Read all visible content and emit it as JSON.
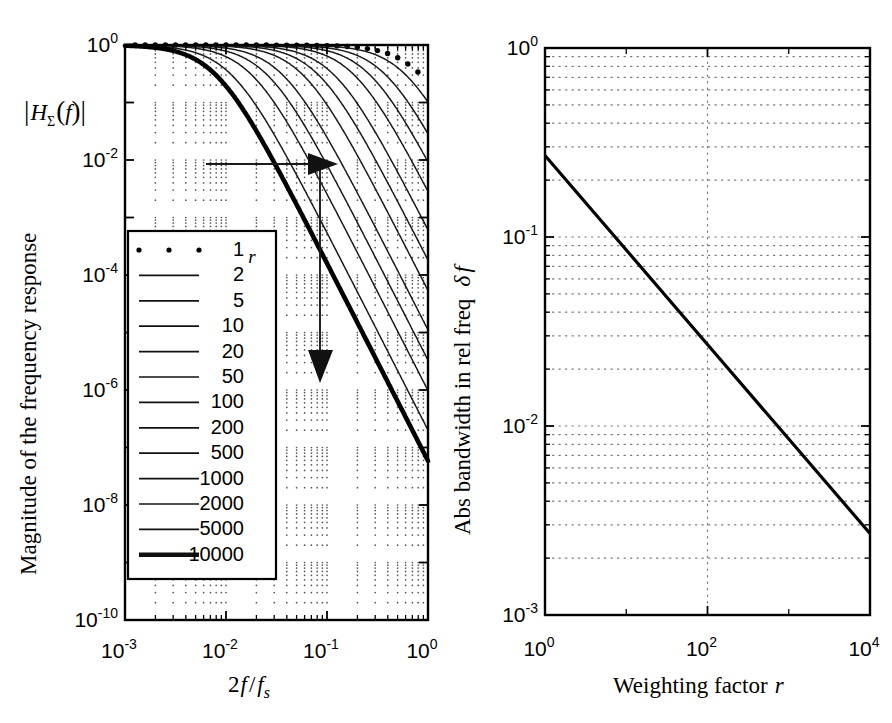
{
  "figure": {
    "title": "",
    "background": "#ffffff",
    "ink_color": "#000000"
  },
  "chart_data": [
    {
      "id": "left-panel",
      "type": "line",
      "title": "",
      "xlabel": "2f/f_s",
      "ylabel": "Magnitude of the frequency response",
      "ylabel_symbol": "|H_Σ(f)|",
      "xscale": "log",
      "yscale": "log",
      "xlim": [
        0.001,
        1.0
      ],
      "ylim": [
        1e-10,
        1.0
      ],
      "xticks": [
        0.001,
        0.01,
        0.1,
        1
      ],
      "xticklabels": [
        "10⁻³",
        "10⁻²",
        "10⁻¹",
        "10⁰"
      ],
      "yticks": [
        1,
        0.01,
        0.0001,
        1e-06,
        1e-08,
        1e-10
      ],
      "yticklabels": [
        "10⁰",
        "10⁻²",
        "10⁻⁴",
        "10⁻⁶",
        "10⁻⁸",
        "10⁻¹⁰"
      ],
      "grid": "dotted-minor",
      "legend_position": "lower-left",
      "legend_title": "r",
      "series": [
        {
          "name": "1",
          "r": 1,
          "style": "dotted-markers",
          "width": 1.5,
          "corner_f": 0.85
        },
        {
          "name": "2",
          "r": 2,
          "style": "solid",
          "width": 1.5,
          "corner_f": 0.6
        },
        {
          "name": "5",
          "r": 5,
          "style": "solid",
          "width": 1.5,
          "corner_f": 0.38
        },
        {
          "name": "10",
          "r": 10,
          "style": "solid",
          "width": 1.5,
          "corner_f": 0.265
        },
        {
          "name": "20",
          "r": 20,
          "style": "solid",
          "width": 1.5,
          "corner_f": 0.185
        },
        {
          "name": "50",
          "r": 50,
          "style": "solid",
          "width": 1.5,
          "corner_f": 0.117
        },
        {
          "name": "100",
          "r": 100,
          "style": "solid",
          "width": 1.5,
          "corner_f": 0.082
        },
        {
          "name": "200",
          "r": 200,
          "style": "solid",
          "width": 1.5,
          "corner_f": 0.0575
        },
        {
          "name": "500",
          "r": 500,
          "style": "solid",
          "width": 1.5,
          "corner_f": 0.0363
        },
        {
          "name": "1000",
          "r": 1000,
          "style": "solid",
          "width": 1.5,
          "corner_f": 0.0255
        },
        {
          "name": "2000",
          "r": 2000,
          "style": "solid",
          "width": 1.5,
          "corner_f": 0.0179
        },
        {
          "name": "5000",
          "r": 5000,
          "style": "solid",
          "width": 1.5,
          "corner_f": 0.0113
        },
        {
          "name": "10000",
          "r": 10000,
          "style": "thick",
          "width": 4.6,
          "corner_f": 0.0079
        }
      ],
      "annotations": [
        {
          "kind": "arrow",
          "direction": "right",
          "from": [
            0.0072,
            0.01
          ],
          "to": [
            0.082,
            0.01
          ]
        },
        {
          "kind": "arrow",
          "direction": "down",
          "from": [
            0.082,
            0.01
          ],
          "to": [
            0.082,
            2.2e-06
          ]
        }
      ]
    },
    {
      "id": "right-panel",
      "type": "line",
      "title": "",
      "xlabel": "Weighting factor r",
      "ylabel": "Abs bandwidth in rel freq  δf",
      "xscale": "log",
      "yscale": "log",
      "xlim": [
        1,
        10000
      ],
      "ylim": [
        0.001,
        1.0
      ],
      "xticks": [
        1,
        100,
        10000
      ],
      "xticklabels": [
        "10⁰",
        "10²",
        "10⁴"
      ],
      "yticks": [
        1,
        0.1,
        0.01,
        0.001
      ],
      "yticklabels": [
        "10⁰",
        "10⁻¹",
        "10⁻²",
        "10⁻³"
      ],
      "grid": "dotted-minor",
      "legend_position": "none",
      "series": [
        {
          "name": "bandwidth",
          "style": "solid",
          "width": 3.2,
          "relation": "delta_f = 0.27 * r^-0.5",
          "x": [
            1,
            10,
            100,
            1000,
            10000
          ],
          "y": [
            0.27,
            0.0854,
            0.027,
            0.00854,
            0.0027
          ]
        }
      ]
    }
  ],
  "left": {
    "ylabel_main": "Magnitude of the frequency response",
    "ylabel_sym_open": "|",
    "ylabel_sym_H": "H",
    "ylabel_sym_sub": "Σ",
    "ylabel_sym_paren_open": "(",
    "ylabel_sym_f": "f",
    "ylabel_sym_paren_close": ")",
    "ylabel_sym_close": "|",
    "xlabel_num": "2",
    "xlabel_f": "f",
    "xlabel_slash": "/",
    "xlabel_fs": "f",
    "xlabel_fs_sub": "s",
    "xticks": [
      {
        "mant": "10",
        "exp": "-3"
      },
      {
        "mant": "10",
        "exp": "-2"
      },
      {
        "mant": "10",
        "exp": "-1"
      },
      {
        "mant": "10",
        "exp": "0"
      }
    ],
    "yticks": [
      {
        "mant": "10",
        "exp": "0"
      },
      {
        "mant": "10",
        "exp": "-2"
      },
      {
        "mant": "10",
        "exp": "-4"
      },
      {
        "mant": "10",
        "exp": "-6"
      },
      {
        "mant": "10",
        "exp": "-8"
      },
      {
        "mant": "10",
        "exp": "-10"
      }
    ],
    "legend": {
      "title": "r",
      "entries": [
        {
          "label": "1",
          "style": "dotted-markers"
        },
        {
          "label": "2",
          "style": "solid"
        },
        {
          "label": "5",
          "style": "solid"
        },
        {
          "label": "10",
          "style": "solid"
        },
        {
          "label": "20",
          "style": "solid"
        },
        {
          "label": "50",
          "style": "solid"
        },
        {
          "label": "100",
          "style": "solid"
        },
        {
          "label": "200",
          "style": "solid"
        },
        {
          "label": "500",
          "style": "solid"
        },
        {
          "label": "1000",
          "style": "solid"
        },
        {
          "label": "2000",
          "style": "solid"
        },
        {
          "label": "5000",
          "style": "solid"
        },
        {
          "label": "10000",
          "style": "thick"
        }
      ]
    }
  },
  "right": {
    "ylabel_main": "Abs bandwidth in rel freq",
    "ylabel_delta": "δ",
    "ylabel_f": "f",
    "xlabel_main": "Weighting factor",
    "xlabel_r": "r",
    "xticks": [
      {
        "mant": "10",
        "exp": "0"
      },
      {
        "mant": "10",
        "exp": "2"
      },
      {
        "mant": "10",
        "exp": "4"
      }
    ],
    "yticks": [
      {
        "mant": "10",
        "exp": "0"
      },
      {
        "mant": "10",
        "exp": "-1"
      },
      {
        "mant": "10",
        "exp": "-2"
      },
      {
        "mant": "10",
        "exp": "-3"
      }
    ]
  }
}
